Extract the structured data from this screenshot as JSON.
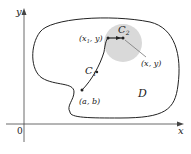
{
  "diagram": {
    "axes": {
      "x_label": "x",
      "y_label": "y",
      "origin_label": "0"
    },
    "region_label": "D",
    "curves": {
      "c1_label": "C",
      "c1_sub": "1",
      "c2_label": "C",
      "c2_sub": "2"
    },
    "points": {
      "start": "(a, b)",
      "mid_x": "(x",
      "mid_sub": "1",
      "mid_tail": ", y)",
      "end": "(x, y)"
    },
    "colors": {
      "disk": "#d9d9d9",
      "curve": "#222222",
      "axis": "#444444"
    }
  }
}
